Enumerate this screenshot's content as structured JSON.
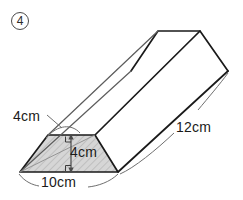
{
  "figure": {
    "item_number": "4",
    "shape_name": "trapezoidal-prism",
    "labels": {
      "slant_side": "4cm",
      "height": "4cm",
      "base": "10cm",
      "length": "12cm"
    },
    "colors": {
      "outline": "#1a1a1a",
      "hidden_edge": "#9a9a9a",
      "face_fill": "#d4d4d4",
      "hatch": "#b6b6b6",
      "leader": "#6f6f6f",
      "background": "#ffffff",
      "text": "#1a1a1a"
    },
    "geometry": {
      "near_face": [
        [
          20,
          172
        ],
        [
          118,
          172
        ],
        [
          95,
          135
        ],
        [
          48,
          135
        ]
      ],
      "far_face": [
        [
          131,
          71
        ],
        [
          228,
          71
        ],
        [
          200,
          31
        ],
        [
          158,
          31
        ]
      ],
      "offset": [
        110,
        -101
      ],
      "height_segment": [
        [
          71,
          135
        ],
        [
          71,
          172
        ]
      ],
      "slant_segment": [
        [
          20,
          172
        ],
        [
          48,
          135
        ]
      ]
    },
    "annotations": {
      "right_angle_top": "right-angle-mark",
      "right_angle_bottom": "right-angle-mark",
      "arc_slant": "dimension-arc",
      "arc_base": "dimension-arc",
      "arc_length": "dimension-arc"
    }
  }
}
